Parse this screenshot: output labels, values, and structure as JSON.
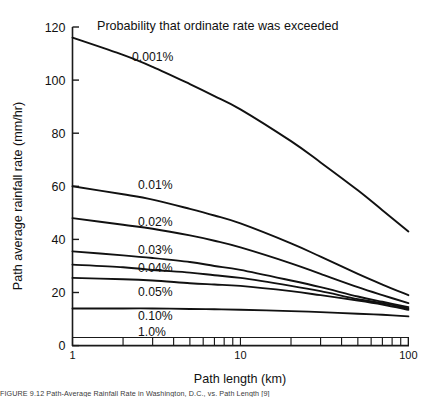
{
  "figure": {
    "caption": "FIGURE 9.12    Path-Average Rainfall Rate in Washington, D.C., vs. Path Length [9]"
  },
  "chart_data": {
    "type": "line",
    "title": "Probability that ordinate rate was exceeded",
    "xlabel": "Path length (km)",
    "ylabel": "Path average rainfall rate (mm/hr)",
    "xscale": "log",
    "xlim": [
      1,
      100
    ],
    "ylim": [
      0,
      120
    ],
    "yticks": [
      0,
      20,
      40,
      60,
      80,
      100,
      120
    ],
    "xticks": [
      1,
      10,
      100
    ],
    "xticklabels": [
      "1",
      "10",
      "100"
    ],
    "grid": false,
    "legend_position": "inline-labels",
    "series": [
      {
        "name": "0.001%",
        "label": "0.001%",
        "x": [
          1,
          2,
          3,
          5,
          7,
          10,
          20,
          30,
          50,
          70,
          100
        ],
        "values": [
          116,
          109.5,
          105,
          98.5,
          94,
          89,
          77,
          69,
          58.5,
          51,
          43
        ]
      },
      {
        "name": "0.01%",
        "label": "0.01%",
        "x": [
          1,
          2,
          3,
          5,
          7,
          10,
          20,
          30,
          50,
          70,
          100
        ],
        "values": [
          60,
          57,
          55,
          51.5,
          49,
          46,
          38.5,
          33.5,
          27,
          23,
          19
        ]
      },
      {
        "name": "0.02%",
        "label": "0.02%",
        "x": [
          1,
          2,
          3,
          5,
          7,
          10,
          20,
          30,
          50,
          70,
          100
        ],
        "values": [
          48,
          45.5,
          44,
          41.5,
          39.5,
          37,
          31,
          27,
          22,
          19,
          16
        ]
      },
      {
        "name": "0.03%",
        "label": "0.03%",
        "x": [
          1,
          2,
          3,
          5,
          7,
          10,
          20,
          30,
          50,
          70,
          100
        ],
        "values": [
          35.5,
          34,
          33,
          31.5,
          30,
          28.5,
          24.5,
          22,
          18.5,
          16.5,
          14.5
        ]
      },
      {
        "name": "0.04%",
        "label": "0.04%",
        "x": [
          1,
          2,
          3,
          5,
          7,
          10,
          20,
          30,
          50,
          70,
          100
        ],
        "values": [
          30.5,
          29.5,
          28.5,
          27.5,
          26.5,
          25.5,
          22.5,
          20.5,
          17.5,
          16,
          14
        ]
      },
      {
        "name": "0.05%",
        "label": "0.05%",
        "x": [
          1,
          2,
          3,
          5,
          7,
          10,
          20,
          30,
          50,
          70,
          100
        ],
        "values": [
          25.5,
          25,
          24.5,
          23.5,
          23,
          22.5,
          20.5,
          19,
          17,
          15.5,
          13.5
        ]
      },
      {
        "name": "0.10%",
        "label": "0.10%",
        "x": [
          1,
          2,
          3,
          5,
          7,
          10,
          20,
          30,
          50,
          70,
          100
        ],
        "values": [
          14,
          14,
          14,
          13.8,
          13.7,
          13.5,
          13,
          12.6,
          12,
          11.6,
          11
        ]
      },
      {
        "name": "1.0%",
        "label": "1.0%",
        "x": [],
        "values": []
      }
    ],
    "curve_labels": [
      {
        "text": "0.001%",
        "x_px": 132,
        "y_px": 61
      },
      {
        "text": "0.01%",
        "x_px": 138,
        "y_px": 189
      },
      {
        "text": "0.02%",
        "x_px": 138,
        "y_px": 226
      },
      {
        "text": "0.03%",
        "x_px": 138,
        "y_px": 254
      },
      {
        "text": "0.04%",
        "x_px": 138,
        "y_px": 272
      },
      {
        "text": "0.05%",
        "x_px": 138,
        "y_px": 296
      },
      {
        "text": "0.10%",
        "x_px": 138,
        "y_px": 320
      },
      {
        "text": "1.0%",
        "x_px": 138,
        "y_px": 336
      }
    ]
  }
}
